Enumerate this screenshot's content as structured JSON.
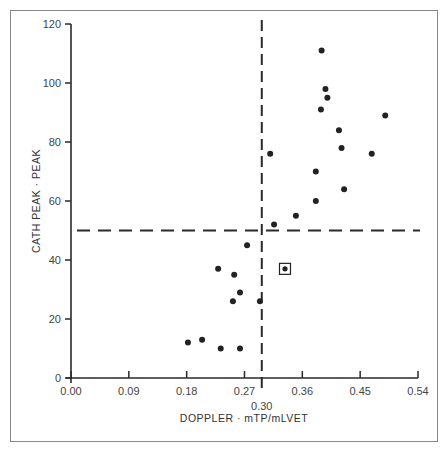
{
  "chart_data": {
    "type": "scatter",
    "title": "",
    "xlabel": "DOPPLER · mTP/mLVET",
    "ylabel": "CATH PEAK · PEAK",
    "xlim": [
      0.0,
      0.54
    ],
    "ylim": [
      0,
      120
    ],
    "x_ticks": [
      "0.00",
      "0.09",
      "0.18",
      "0.27",
      "0.36",
      "0.45",
      "0.54"
    ],
    "y_ticks": [
      "0",
      "20",
      "40",
      "60",
      "80",
      "100",
      "120"
    ],
    "grid": false,
    "legend": null,
    "threshold_lines": [
      {
        "orientation": "vertical",
        "x": 0.3,
        "label": "0.30",
        "style": "dashed"
      },
      {
        "orientation": "horizontal",
        "y": 50,
        "style": "dashed"
      }
    ],
    "points": [
      {
        "x": 0.39,
        "y": 111
      },
      {
        "x": 0.396,
        "y": 98
      },
      {
        "x": 0.399,
        "y": 95
      },
      {
        "x": 0.389,
        "y": 91
      },
      {
        "x": 0.489,
        "y": 89
      },
      {
        "x": 0.417,
        "y": 84
      },
      {
        "x": 0.421,
        "y": 78
      },
      {
        "x": 0.468,
        "y": 76
      },
      {
        "x": 0.31,
        "y": 76
      },
      {
        "x": 0.381,
        "y": 70
      },
      {
        "x": 0.425,
        "y": 64
      },
      {
        "x": 0.381,
        "y": 60
      },
      {
        "x": 0.35,
        "y": 55
      },
      {
        "x": 0.316,
        "y": 52
      },
      {
        "x": 0.274,
        "y": 45
      },
      {
        "x": 0.229,
        "y": 37
      },
      {
        "x": 0.254,
        "y": 35
      },
      {
        "x": 0.263,
        "y": 29
      },
      {
        "x": 0.252,
        "y": 26
      },
      {
        "x": 0.294,
        "y": 26
      },
      {
        "x": 0.182,
        "y": 12
      },
      {
        "x": 0.204,
        "y": 13
      },
      {
        "x": 0.233,
        "y": 10
      },
      {
        "x": 0.263,
        "y": 10
      }
    ],
    "highlighted_points": [
      {
        "x": 0.333,
        "y": 37,
        "marker": "boxed"
      }
    ]
  }
}
